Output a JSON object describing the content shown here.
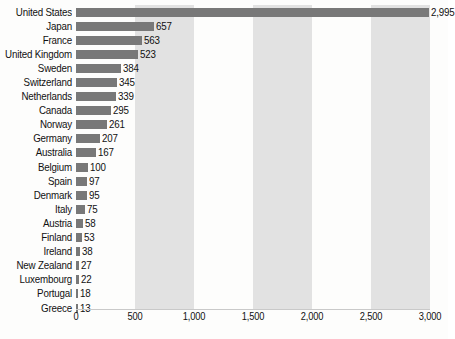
{
  "chart_data": {
    "type": "bar",
    "orientation": "horizontal",
    "title": "",
    "xlabel": "",
    "ylabel": "",
    "xlim": [
      0,
      3000
    ],
    "grid": false,
    "legend": null,
    "xticks": [
      "0",
      "500",
      "1,000",
      "1,500",
      "2,000",
      "2,500",
      "3,000"
    ],
    "xtick_values": [
      0,
      500,
      1000,
      1500,
      2000,
      2500,
      3000
    ],
    "categories": [
      "United States",
      "Japan",
      "France",
      "United Kingdom",
      "Sweden",
      "Switzerland",
      "Netherlands",
      "Canada",
      "Norway",
      "Germany",
      "Australia",
      "Belgium",
      "Spain",
      "Denmark",
      "Italy",
      "Austria",
      "Finland",
      "Ireland",
      "New Zealand",
      "Luxembourg",
      "Portugal",
      "Greece"
    ],
    "values": [
      2995,
      657,
      563,
      523,
      384,
      345,
      339,
      295,
      261,
      207,
      167,
      100,
      97,
      95,
      75,
      58,
      53,
      38,
      27,
      22,
      18,
      13
    ],
    "value_labels": [
      "2,995",
      "657",
      "563",
      "523",
      "384",
      "345",
      "339",
      "295",
      "261",
      "207",
      "167",
      "100",
      "97",
      "95",
      "75",
      "58",
      "53",
      "38",
      "27",
      "22",
      "18",
      "13"
    ],
    "bar_color": "#787878",
    "band_color": "#e2e2e2",
    "background_color": "#fdfdfc"
  }
}
